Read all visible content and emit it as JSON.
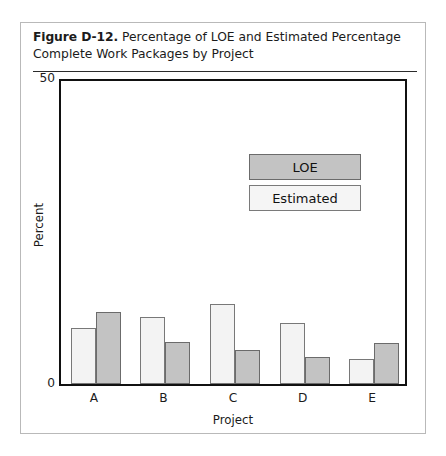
{
  "figure": {
    "number_label": "Figure D-12.",
    "caption": "Percentage of LOE and Estimated Percentage Complete Work Packages by Project"
  },
  "legend": {
    "loe_label": "LOE",
    "estimated_label": "Estimated"
  },
  "axes": {
    "y_title": "Percent",
    "y_tick_top": "50",
    "y_tick_bottom": "0",
    "x_title": "Project"
  },
  "colors": {
    "loe_fill": "#c3c3c3",
    "estimated_fill": "#f3f3f3",
    "bar_outline": "#6e6e6e",
    "frame": "#111111",
    "figure_border": "#b9b9b9",
    "rule": "#2b2b2b"
  },
  "chart_data": {
    "type": "bar",
    "title": "Percentage of LOE and Estimated Percentage Complete Work Packages by Project",
    "xlabel": "Project",
    "ylabel": "Percent",
    "ylim": [
      0,
      50
    ],
    "yticks": [
      0,
      50
    ],
    "grid": false,
    "legend_position": "upper right",
    "categories": [
      "A",
      "B",
      "C",
      "D",
      "E"
    ],
    "series": [
      {
        "name": "Estimated",
        "values": [
          9.1,
          10.9,
          13.0,
          10.0,
          4.0
        ]
      },
      {
        "name": "LOE",
        "values": [
          11.7,
          6.8,
          5.5,
          4.4,
          6.7
        ]
      }
    ]
  }
}
